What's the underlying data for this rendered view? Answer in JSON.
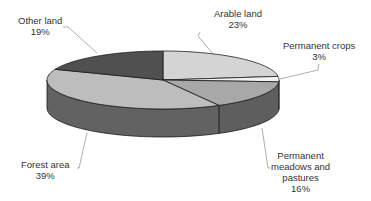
{
  "chart_data": {
    "type": "pie",
    "style": "3d",
    "title": "",
    "categories": [
      "Arable land",
      "Permanent crops",
      "Permanent meadows and pastures",
      "Forest area",
      "Other land"
    ],
    "values": [
      23,
      3,
      16,
      39,
      19
    ],
    "unit": "%",
    "colors": [
      "#d4d4d4",
      "#f2f2f2",
      "#a8a8a8",
      "#bdbdbd",
      "#505050"
    ],
    "side_colors": [
      "#6a6a6a",
      "#7a7a7a",
      "#5e5e5e",
      "#626262",
      "#3a3a3a"
    ],
    "legend": "none",
    "labels": [
      {
        "name": "Arable land",
        "lines": [
          "Arable land",
          "23%"
        ]
      },
      {
        "name": "Permanent crops",
        "lines": [
          "Permanent crops",
          "3%"
        ]
      },
      {
        "name": "Permanent meadows and pastures",
        "lines": [
          "Permanent",
          "meadows and",
          "pastures",
          "16%"
        ]
      },
      {
        "name": "Forest area",
        "lines": [
          "Forest area",
          "39%"
        ]
      },
      {
        "name": "Other land",
        "lines": [
          "Other land",
          "19%"
        ]
      }
    ]
  }
}
